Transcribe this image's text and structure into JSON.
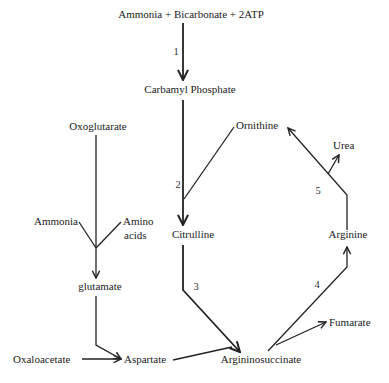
{
  "diagram": {
    "nodes": {
      "reactants": "Ammonia + Bicarbonate + 2ATP",
      "carbamyl_phosphate": "Carbamyl Phosphate",
      "oxoglutarate": "Oxoglutarate",
      "ornithine": "Ornithine",
      "urea": "Urea",
      "ammonia": "Ammonia",
      "amino_acids_line1": "Amino",
      "amino_acids_line2": "acids",
      "citrulline": "Citrulline",
      "arginine": "Arginine",
      "glutamate": "glutamate",
      "fumarate": "Fumarate",
      "oxaloacetate": "Oxaloacetate",
      "aspartate": "Aspartate",
      "argininosuccinate": "Argininosuccinate"
    },
    "steps": {
      "s1": "1",
      "s2": "2",
      "s3": "3",
      "s4": "4",
      "s5": "5"
    },
    "edges": [
      {
        "from": "reactants",
        "to": "carbamyl_phosphate",
        "step": "1"
      },
      {
        "from": "carbamyl_phosphate",
        "to": "citrulline",
        "step": "2"
      },
      {
        "from": "ornithine",
        "to": "citrulline",
        "step": "2"
      },
      {
        "from": "citrulline",
        "to": "argininosuccinate",
        "step": "3"
      },
      {
        "from": "aspartate",
        "to": "argininosuccinate",
        "step": "3"
      },
      {
        "from": "argininosuccinate",
        "to": "arginine",
        "step": "4"
      },
      {
        "from": "argininosuccinate",
        "to": "fumarate",
        "step": "4"
      },
      {
        "from": "arginine",
        "to": "ornithine",
        "step": "5"
      },
      {
        "from": "arginine",
        "to": "urea",
        "step": "5"
      },
      {
        "from": "oxoglutarate",
        "to": "glutamate"
      },
      {
        "from": "ammonia",
        "to": "glutamate"
      },
      {
        "from": "amino_acids",
        "to": "glutamate"
      },
      {
        "from": "glutamate",
        "to": "aspartate"
      },
      {
        "from": "oxaloacetate",
        "to": "aspartate"
      }
    ]
  }
}
